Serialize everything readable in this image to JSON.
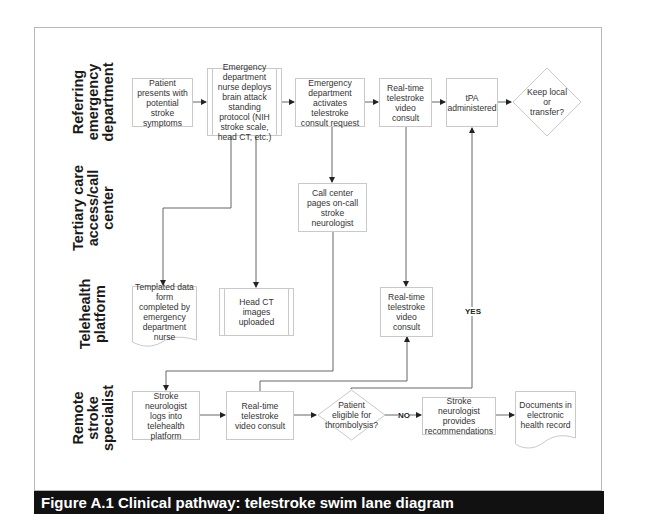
{
  "caption": "Figure A.1  Clinical pathway: telestroke swim lane diagram",
  "lanes": [
    {
      "label": "Referring emergency department"
    },
    {
      "label": "Tertiary care access/call center"
    },
    {
      "label": "Telehealth platform"
    },
    {
      "label": "Remote stroke specialist"
    }
  ],
  "nodes": {
    "patient_presents": "Patient presents with potential stroke symptoms",
    "ed_nurse_protocol": "Emergency department nurse deploys brain attack standing protocol (NIH stroke scale, head CT, etc.)",
    "ed_activates_consult": "Emergency department activates telestroke consult request",
    "rt_consult_referring": "Real-time telestroke video consult",
    "tpa_administered": "tPA administered",
    "keep_local_or_transfer": "Keep local or transfer?",
    "call_center_pages": "Call center pages on-call stroke neurologist",
    "templated_form": "Templated data form completed by emergency department nurse",
    "head_ct_uploaded": "Head CT images uploaded",
    "rt_consult_platform": "Real-time telestroke video consult",
    "neurologist_logs_in": "Stroke neurologist logs into telehealth platform",
    "rt_consult_specialist": "Real-time telestroke video consult",
    "eligible_thrombolysis": "Patient eligible for thrombolysis?",
    "neurologist_recommendations": "Stroke neurologist provides recommendations",
    "documents_ehr": "Documents in electronic health record"
  },
  "edge_labels": {
    "yes": "YES",
    "no": "NO"
  },
  "colors": {
    "caption_bg": "#111111",
    "caption_text": "#ffffff",
    "box_border": "#c9c9c9",
    "connector": "#555555",
    "frame_border": "#b8b8b8"
  }
}
